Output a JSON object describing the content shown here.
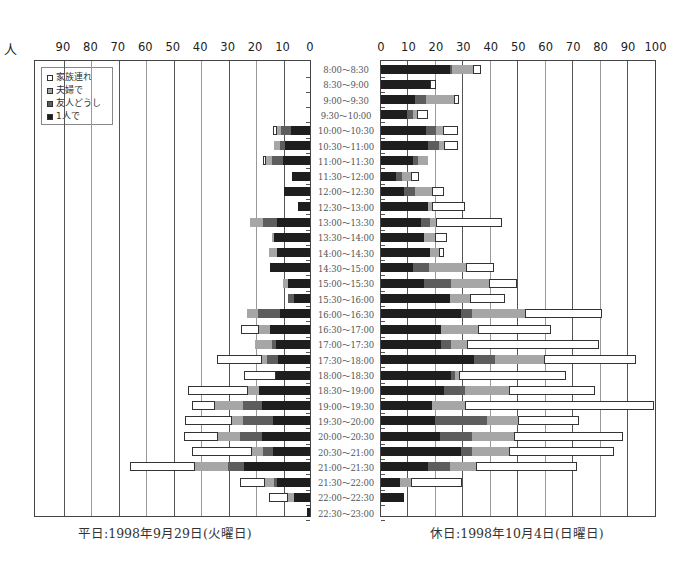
{
  "chart_data": [
    {
      "type": "bar",
      "orientation": "horizontal-stacked",
      "title": "平日:1998年9月29日(火曜日)",
      "xlabel": "人",
      "direction": "right-to-left",
      "xlim": [
        0,
        100
      ],
      "xticks": [
        0,
        10,
        20,
        30,
        40,
        50,
        60,
        70,
        80,
        90
      ],
      "grid": true,
      "legend_position": "top-left",
      "categories": [
        "8:00〜8:30",
        "8:30〜9:00",
        "9:00〜9:30",
        "9:30〜10:00",
        "10:00〜10:30",
        "10:30〜11:00",
        "11:00〜11:30",
        "11:30〜12:00",
        "12:00〜12:30",
        "12:30〜13:00",
        "13:00〜13:30",
        "13:30〜14:00",
        "14:00〜14:30",
        "14:30〜15:00",
        "15:00〜15:30",
        "15:30〜16:00",
        "16:00〜16:30",
        "16:30〜17:00",
        "17:00〜17:30",
        "17:30〜18:00",
        "18:00〜18:30",
        "18:30〜19:00",
        "19:00〜19:30",
        "19:30〜20:00",
        "20:00〜20:30",
        "20:30〜21:00",
        "21:00〜21:30",
        "21:30〜22:00",
        "22:00〜22:30",
        "22:30〜23:00"
      ],
      "series": [
        {
          "name": "1人で",
          "values": [
            0,
            0,
            0,
            0,
            7,
            9,
            10,
            6.5,
            9.5,
            4.5,
            12,
            13,
            12,
            14.5,
            8,
            6,
            11,
            14.5,
            12.5,
            11.5,
            12.5,
            18.5,
            17.5,
            13.5,
            17.5,
            13.5,
            24,
            12,
            6,
            1
          ]
        },
        {
          "name": "友人どうし",
          "values": [
            0,
            0,
            0,
            0,
            3.5,
            2,
            4,
            0,
            0,
            0,
            5,
            0,
            0,
            0,
            0,
            2,
            8,
            0,
            1.5,
            4,
            0,
            0,
            7,
            11,
            8,
            3.5,
            6,
            1,
            0,
            0
          ]
        },
        {
          "name": "夫婦で",
          "values": [
            0,
            0,
            0,
            0,
            1.5,
            2,
            2,
            0,
            0,
            0,
            5,
            1,
            3,
            0,
            2,
            0,
            4,
            4,
            6,
            2,
            0,
            4,
            10,
            4,
            8,
            4,
            12,
            3.5,
            2,
            0
          ]
        },
        {
          "name": "家族連れ",
          "values": [
            0,
            0,
            0,
            0,
            1.5,
            0,
            1,
            0,
            0,
            0,
            0,
            0,
            0,
            0,
            0,
            0,
            0,
            6.5,
            0,
            16.5,
            11.5,
            22,
            8.5,
            17,
            12.5,
            22,
            23.5,
            9,
            7,
            0
          ]
        }
      ]
    },
    {
      "type": "bar",
      "orientation": "horizontal-stacked",
      "title": "休日:1998年10月4日(日曜日)",
      "xlabel": "",
      "direction": "left-to-right",
      "xlim": [
        0,
        100
      ],
      "xticks": [
        0,
        10,
        20,
        30,
        40,
        50,
        60,
        70,
        80,
        90,
        100
      ],
      "grid": true,
      "categories": [
        "8:00〜8:30",
        "8:30〜9:00",
        "9:00〜9:30",
        "9:30〜10:00",
        "10:00〜10:30",
        "10:30〜11:00",
        "11:00〜11:30",
        "11:30〜12:00",
        "12:00〜12:30",
        "12:30〜13:00",
        "13:00〜13:30",
        "13:30〜14:00",
        "14:00〜14:30",
        "14:30〜15:00",
        "15:00〜15:30",
        "15:30〜16:00",
        "16:00〜16:30",
        "16:30〜17:00",
        "17:00〜17:30",
        "17:30〜18:00",
        "18:00〜18:30",
        "18:30〜19:00",
        "19:00〜19:30",
        "19:30〜20:00",
        "20:00〜20:30",
        "20:30〜21:00",
        "21:00〜21:30",
        "21:30〜22:00",
        "22:00〜22:30",
        "22:30〜23:00"
      ],
      "series": [
        {
          "name": "1人で",
          "values": [
            25,
            18,
            12.5,
            9.5,
            16.5,
            17,
            11.5,
            5.5,
            8.5,
            17,
            14.5,
            15.5,
            18,
            11.5,
            15.5,
            25,
            29,
            22,
            22,
            34,
            25.5,
            23,
            18.5,
            19.5,
            21.5,
            29,
            17,
            7,
            8.5,
            0
          ]
        },
        {
          "name": "友人どうし",
          "values": [
            1,
            0,
            4,
            2,
            3.5,
            4,
            2,
            2,
            4,
            0,
            3.5,
            0,
            0,
            6,
            10,
            0,
            4,
            0,
            3.5,
            7.5,
            1.5,
            7.5,
            0,
            19,
            11.5,
            4,
            8,
            0,
            0,
            0
          ]
        },
        {
          "name": "夫婦で",
          "values": [
            7.5,
            0,
            10,
            1.5,
            2.5,
            2,
            3.5,
            3.5,
            6,
            1.5,
            2,
            4,
            3,
            13.5,
            14,
            7.5,
            19.5,
            13.5,
            6,
            18,
            1.5,
            16,
            12,
            11.5,
            15.5,
            13.5,
            9.5,
            4,
            0,
            0
          ]
        },
        {
          "name": "家族連れ",
          "values": [
            3,
            2,
            2,
            4,
            5.5,
            5,
            0,
            3,
            4.5,
            12,
            24,
            4.5,
            2,
            10,
            10,
            12.5,
            28,
            26.5,
            48,
            33.5,
            39,
            31.5,
            69,
            22,
            39.5,
            38.5,
            37,
            18.5,
            0,
            0
          ]
        }
      ]
    }
  ],
  "legend": {
    "items": [
      {
        "label": "家族連れ",
        "key": "family",
        "color": "#ffffff"
      },
      {
        "label": "夫婦で",
        "key": "couple",
        "color": "#a6a6a6"
      },
      {
        "label": "友人どうし",
        "key": "friends",
        "color": "#5d5d5d"
      },
      {
        "label": "1人で",
        "key": "solo",
        "color": "#1e1e1e"
      }
    ]
  },
  "axis": {
    "unit": "人",
    "left_ticks": [
      "90",
      "80",
      "70",
      "60",
      "50",
      "40",
      "30",
      "20",
      "10",
      "0"
    ],
    "right_ticks": [
      "0",
      "10",
      "20",
      "30",
      "40",
      "50",
      "60",
      "70",
      "80",
      "90",
      "100"
    ]
  },
  "captions": {
    "left": "平日:1998年9月29日(火曜日)",
    "right": "休日:1998年10月4日(日曜日)"
  },
  "time_slots": [
    "8:00〜8:30",
    "8:30〜9:00",
    "9:00〜9:30",
    "9:30〜10:00",
    "10:00〜10:30",
    "10:30〜11:00",
    "11:00〜11:30",
    "11:30〜12:00",
    "12:00〜12:30",
    "12:30〜13:00",
    "13:00〜13:30",
    "13:30〜14:00",
    "14:00〜14:30",
    "14:30〜15:00",
    "15:00〜15:30",
    "15:30〜16:00",
    "16:00〜16:30",
    "16:30〜17:00",
    "17:00〜17:30",
    "17:30〜18:00",
    "18:00〜18:30",
    "18:30〜19:00",
    "19:00〜19:30",
    "19:30〜20:00",
    "20:00〜20:30",
    "20:30〜21:00",
    "21:00〜21:30",
    "21:30〜22:00",
    "22:00〜22:30",
    "22:30〜23:00"
  ]
}
